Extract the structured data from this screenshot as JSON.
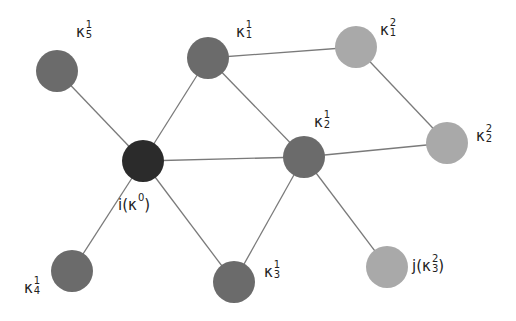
{
  "diagram": {
    "colors": {
      "center": "#2b2b2b",
      "order1": "#6b6b6b",
      "order2": "#a9a9a9",
      "edge": "#7a7a7a",
      "text": "#222222"
    },
    "node_radius": 21,
    "nodes": [
      {
        "id": "i",
        "x": 143,
        "y": 161,
        "order": 0,
        "label": {
          "prefix": "i(",
          "sym": "κ",
          "sup": "0",
          "sub": "",
          "suffix": ")",
          "x": 118,
          "y": 195
        }
      },
      {
        "id": "k5_1",
        "x": 57,
        "y": 71,
        "order": 1,
        "label": {
          "prefix": "",
          "sym": "κ",
          "sup": "1",
          "sub": "5",
          "suffix": "",
          "x": 76,
          "y": 22
        }
      },
      {
        "id": "k1_1",
        "x": 208,
        "y": 58,
        "order": 1,
        "label": {
          "prefix": "",
          "sym": "κ",
          "sup": "1",
          "sub": "1",
          "suffix": "",
          "x": 236,
          "y": 22
        }
      },
      {
        "id": "k2_1",
        "x": 304,
        "y": 157,
        "order": 1,
        "label": {
          "prefix": "",
          "sym": "κ",
          "sup": "1",
          "sub": "2",
          "suffix": "",
          "x": 314,
          "y": 112
        }
      },
      {
        "id": "k4_1",
        "x": 72,
        "y": 271,
        "order": 1,
        "label": {
          "prefix": "",
          "sym": "κ",
          "sup": "1",
          "sub": "4",
          "suffix": "",
          "x": 24,
          "y": 278
        }
      },
      {
        "id": "k3_1",
        "x": 234,
        "y": 282,
        "order": 1,
        "label": {
          "prefix": "",
          "sym": "κ",
          "sup": "1",
          "sub": "3",
          "suffix": "",
          "x": 264,
          "y": 262
        }
      },
      {
        "id": "k1_2",
        "x": 356,
        "y": 47,
        "order": 2,
        "label": {
          "prefix": "",
          "sym": "κ",
          "sup": "2",
          "sub": "1",
          "suffix": "",
          "x": 380,
          "y": 20
        }
      },
      {
        "id": "k2_2",
        "x": 447,
        "y": 143,
        "order": 2,
        "label": {
          "prefix": "",
          "sym": "κ",
          "sup": "2",
          "sub": "2",
          "suffix": "",
          "x": 476,
          "y": 126
        }
      },
      {
        "id": "j",
        "x": 387,
        "y": 267,
        "order": 2,
        "label": {
          "prefix": "j(",
          "sym": "κ",
          "sup": "2",
          "sub": "3",
          "suffix": ")",
          "x": 412,
          "y": 256
        }
      }
    ],
    "edges": [
      [
        "i",
        "k5_1"
      ],
      [
        "i",
        "k1_1"
      ],
      [
        "i",
        "k2_1"
      ],
      [
        "i",
        "k4_1"
      ],
      [
        "i",
        "k3_1"
      ],
      [
        "k1_1",
        "k1_2"
      ],
      [
        "k1_1",
        "k2_1"
      ],
      [
        "k1_2",
        "k2_2"
      ],
      [
        "k2_1",
        "k2_2"
      ],
      [
        "k2_1",
        "k3_1"
      ],
      [
        "k2_1",
        "j"
      ]
    ]
  }
}
